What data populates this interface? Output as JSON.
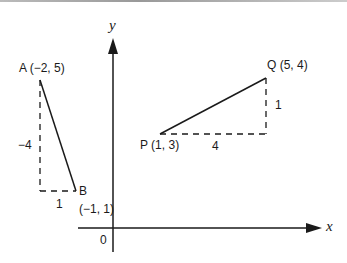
{
  "axes": {
    "x_label": "x",
    "y_label": "y",
    "origin_label": "0"
  },
  "segments": [
    {
      "name": "AB",
      "start": {
        "label": "A (−2, 5)",
        "x": -2,
        "y": 5
      },
      "end": {
        "label": "B",
        "coord_label": "(−1, 1)",
        "x": -1,
        "y": 1
      },
      "rise_label": "−4",
      "run_label": "1"
    },
    {
      "name": "PQ",
      "start": {
        "label": "P (1, 3)",
        "x": 1,
        "y": 3
      },
      "end": {
        "label": "Q (5, 4)",
        "x": 5,
        "y": 4
      },
      "rise_label": "1",
      "run_label": "4"
    }
  ],
  "colors": {
    "line": "#1a1a1a",
    "background": "#ffffff"
  }
}
